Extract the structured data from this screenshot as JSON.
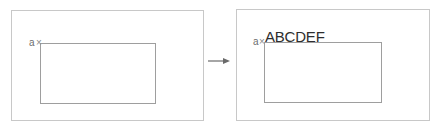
{
  "diagram": {
    "before": {
      "anchor_label": "a",
      "anchor_marker": "×"
    },
    "transition_arrow": "→",
    "after": {
      "anchor_label": "a",
      "anchor_marker": "×",
      "inserted_text": "ABCDEF"
    },
    "colors": {
      "outer_border": "#c8c8c8",
      "inner_border": "#9e9e9e",
      "arrow": "#6a6a6a",
      "text": "#2e2e2e"
    }
  }
}
